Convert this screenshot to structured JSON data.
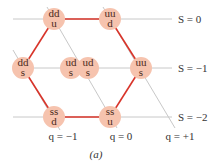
{
  "diagram": {
    "caption": "(a)",
    "colors": {
      "grid_line": "#c8c8c8",
      "hexagon_edge": "#d8342a",
      "node_fill": "#f6c3ae",
      "node_text": "#4a2a20",
      "label_text": "#333333"
    },
    "strangeness_labels": [
      {
        "text": "S = 0",
        "y": 19
      },
      {
        "text": "S = −1",
        "y": 68
      },
      {
        "text": "S = −2",
        "y": 117
      }
    ],
    "charge_labels": [
      {
        "text": "q = −1",
        "x": 63
      },
      {
        "text": "q = 0",
        "x": 121
      },
      {
        "text": "q = +1",
        "x": 180
      }
    ],
    "nodes": [
      {
        "id": "ddu",
        "top": "dd",
        "bottom": "u",
        "x": 54,
        "y": 19
      },
      {
        "id": "uud",
        "top": "uu",
        "bottom": "d",
        "x": 110,
        "y": 19
      },
      {
        "id": "dds",
        "top": "dd",
        "bottom": "s",
        "x": 23,
        "y": 68
      },
      {
        "id": "uds-left",
        "top": "ud",
        "bottom": "s",
        "x": 71,
        "y": 68
      },
      {
        "id": "uds-right",
        "top": "ud",
        "bottom": "s",
        "x": 88,
        "y": 68
      },
      {
        "id": "uus",
        "top": "uu",
        "bottom": "s",
        "x": 141,
        "y": 68
      },
      {
        "id": "ssd",
        "top": "ss",
        "bottom": "d",
        "x": 54,
        "y": 117
      },
      {
        "id": "ssu",
        "top": "ss",
        "bottom": "u",
        "x": 110,
        "y": 117
      }
    ]
  }
}
